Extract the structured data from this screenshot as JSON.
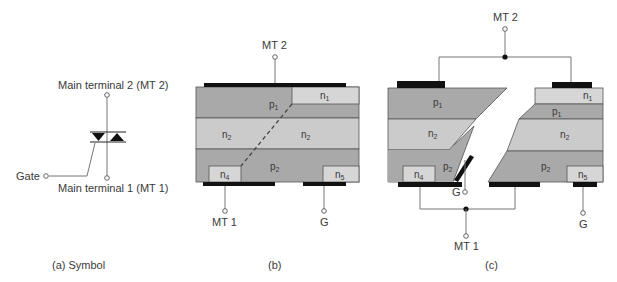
{
  "colors": {
    "p_layer": "#a9a9a9",
    "n_layer": "#cbcbcb",
    "n_small": "#d6d6d6",
    "electrode": "#111111",
    "wire": "#777777",
    "outline": "#555555",
    "text": "#3a3a3a"
  },
  "symbol": {
    "mt2_label": "Main terminal 2 (MT 2)",
    "mt1_label": "Main terminal 1 (MT 1)",
    "gate_label": "Gate",
    "caption": "(a)  Symbol"
  },
  "structure_b": {
    "mt2": "MT 2",
    "mt1": "MT 1",
    "gate": "G",
    "caption": "(b)",
    "layers": {
      "p1": {
        "base": "p",
        "sub": "1"
      },
      "n1": {
        "base": "n",
        "sub": "1"
      },
      "n2_left": {
        "base": "n",
        "sub": "2"
      },
      "n2_right": {
        "base": "n",
        "sub": "2"
      },
      "p2": {
        "base": "p",
        "sub": "2"
      },
      "n4": {
        "base": "n",
        "sub": "4"
      },
      "n5": {
        "base": "n",
        "sub": "5"
      }
    }
  },
  "structure_c": {
    "mt2": "MT 2",
    "mt1": "MT 1",
    "gate_left": "G",
    "gate_right": "G",
    "caption": "(c)",
    "left_layers": {
      "p1": {
        "base": "p",
        "sub": "1"
      },
      "n2": {
        "base": "n",
        "sub": "2"
      },
      "p2": {
        "base": "p",
        "sub": "2"
      },
      "n4": {
        "base": "n",
        "sub": "4"
      }
    },
    "right_layers": {
      "n1": {
        "base": "n",
        "sub": "1"
      },
      "p1": {
        "base": "p",
        "sub": "1"
      },
      "n2": {
        "base": "n",
        "sub": "2"
      },
      "p2": {
        "base": "p",
        "sub": "2"
      },
      "n5": {
        "base": "n",
        "sub": "5"
      }
    }
  }
}
